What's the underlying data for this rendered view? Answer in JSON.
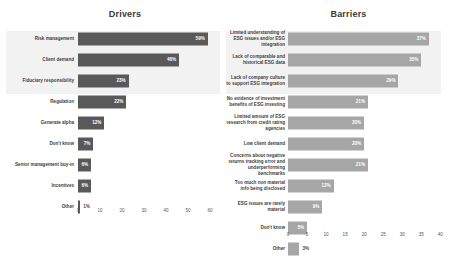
{
  "chart_data": [
    {
      "type": "bar",
      "title": "Drivers",
      "orientation": "horizontal",
      "xlabel": "",
      "ylabel": "",
      "xlim": [
        0,
        65
      ],
      "xticks": [
        0,
        10,
        20,
        30,
        40,
        50,
        60
      ],
      "grid": false,
      "bar_color": "#595959",
      "highlight_rows": 3,
      "categories": [
        "Risk management",
        "Client demand",
        "Fiduciary responsibility",
        "Regulation",
        "Generate alpha",
        "Don't know",
        "Senior management buy-in",
        "Incentives",
        "Other"
      ],
      "values": [
        59,
        46,
        23,
        22,
        12,
        7,
        6,
        6,
        1
      ],
      "value_labels": [
        "59%",
        "46%",
        "23%",
        "22%",
        "12%",
        "7%",
        "6%",
        "6%",
        "1%"
      ]
    },
    {
      "type": "bar",
      "title": "Barriers",
      "orientation": "horizontal",
      "xlabel": "",
      "ylabel": "",
      "xlim": [
        0,
        42
      ],
      "xticks": [
        0,
        5,
        10,
        15,
        20,
        25,
        30,
        35,
        40
      ],
      "grid": false,
      "bar_color": "#a6a6a6",
      "highlight_rows": 3,
      "categories": [
        "Limited understanding of ESG issues and/or ESG integration",
        "Lack of comparable and historical ESG data",
        "Lack of company culture to support ESG integration",
        "No evidence of investment benefits of ESG investing",
        "Limited amount of ESG research from credit rating agencies",
        "Low client demand",
        "Concerns about negative returns tracking error and underperforming benchmarks",
        "Too much non material info being disclosed",
        "ESG issues are rarely material",
        "Don't know",
        "Other"
      ],
      "values": [
        37,
        35,
        29,
        21,
        20,
        20,
        21,
        12,
        9,
        5,
        3
      ],
      "value_labels": [
        "37%",
        "35%",
        "29%",
        "21%",
        "20%",
        "20%",
        "21%",
        "12%",
        "9%",
        "5%",
        "3%"
      ]
    }
  ]
}
